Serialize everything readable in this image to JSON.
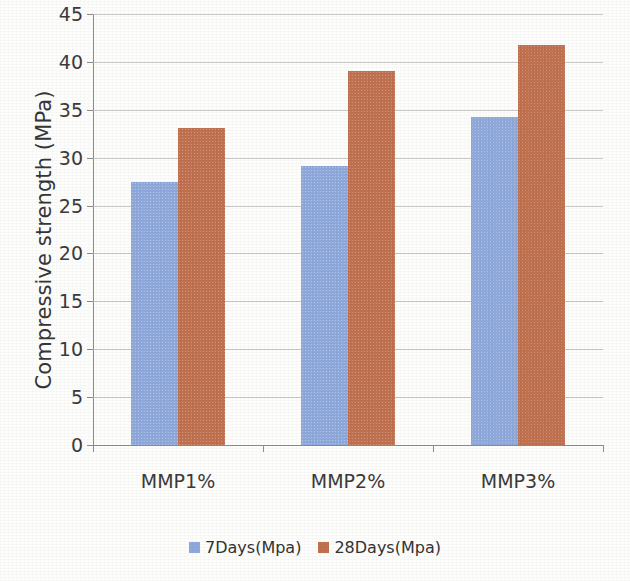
{
  "chart_data": {
    "type": "bar",
    "title": "",
    "xlabel": "",
    "ylabel": "Compressive strength (MPa)",
    "categories": [
      "MMP1%",
      "MMP2%",
      "MMP3%"
    ],
    "series": [
      {
        "name": "7Days(Mpa)",
        "color": "#8fa9dc",
        "values": [
          27.5,
          29.1,
          34.2
        ]
      },
      {
        "name": "28Days(Mpa)",
        "color": "#c0714f",
        "values": [
          33.1,
          39.1,
          41.8
        ]
      }
    ],
    "ylim": [
      0,
      45
    ],
    "ytick_step": 5,
    "ytick_labels": [
      "0",
      "5",
      "10",
      "15",
      "20",
      "25",
      "30",
      "35",
      "40",
      "45"
    ],
    "grid": "horizontal",
    "legend_position": "bottom-center"
  },
  "legend": {
    "items": [
      {
        "label": "7Days(Mpa)"
      },
      {
        "label": "28Days(Mpa)"
      }
    ]
  }
}
